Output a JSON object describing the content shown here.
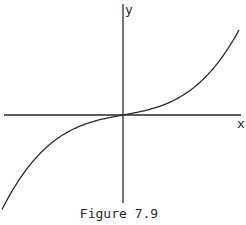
{
  "figure": {
    "caption": "Figure 7.9",
    "x_label": "x",
    "y_label": "y",
    "ink_color": "#2a2a2a",
    "background": "#ffffff"
  },
  "chart_data": {
    "type": "line",
    "title": "Figure 7.9",
    "xlabel": "x",
    "ylabel": "y",
    "grid": false,
    "legend": null,
    "ticks": "none",
    "series": [
      {
        "name": "curve",
        "x": [
          -121,
          -93,
          -57,
          -30,
          0,
          30,
          57,
          87,
          116
        ],
        "y": [
          94,
          50,
          18,
          6,
          0,
          6,
          18,
          42,
          85
        ]
      }
    ]
  }
}
